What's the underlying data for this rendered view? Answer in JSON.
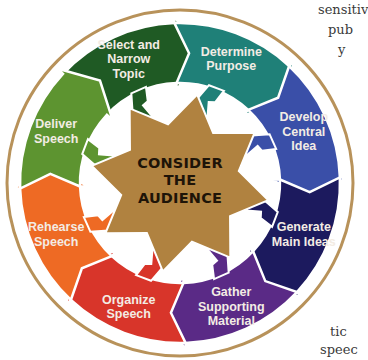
{
  "diagram": {
    "center": {
      "lines": [
        "CONSIDER",
        "THE",
        "AUDIENCE"
      ],
      "color": "#b08240"
    },
    "ring_color": "#b8925a",
    "segments": [
      {
        "id": "select-topic",
        "lines": [
          "Select and",
          "Narrow",
          "Topic"
        ],
        "color": "#1f5a24"
      },
      {
        "id": "determine-purpose",
        "lines": [
          "Determine",
          "Purpose"
        ],
        "color": "#1f8078"
      },
      {
        "id": "develop-central-idea",
        "lines": [
          "Develop",
          "Central",
          "Idea"
        ],
        "color": "#3a4fa8"
      },
      {
        "id": "generate-main-ideas",
        "lines": [
          "Generate",
          "Main Ideas"
        ],
        "color": "#1c1a5e"
      },
      {
        "id": "gather-supporting-material",
        "lines": [
          "Gather",
          "Supporting",
          "Material"
        ],
        "color": "#5a2a86"
      },
      {
        "id": "organize-speech",
        "lines": [
          "Organize",
          "Speech"
        ],
        "color": "#d8352a"
      },
      {
        "id": "rehearse-speech",
        "lines": [
          "Rehearse",
          "Speech"
        ],
        "color": "#ee6a24"
      },
      {
        "id": "deliver-speech",
        "lines": [
          "Deliver",
          "Speech"
        ],
        "color": "#5d9430"
      }
    ]
  },
  "side_text": {
    "top_right": [
      "sensitiv",
      "pub",
      "y"
    ],
    "bottom_right": [
      "tic",
      "speec"
    ]
  }
}
